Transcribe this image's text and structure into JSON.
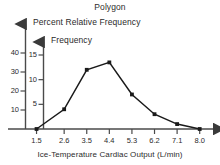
{
  "chart_data": {
    "type": "line",
    "title": "Polygon",
    "xlabel": "Ice-Temperature Cardiac Output (L/min)",
    "ylabel": "Frequency",
    "ylabel_secondary": "Percent Relative Frequency",
    "legend": [],
    "grid": false,
    "categories": [
      "1.5",
      "2.6",
      "3.5",
      "4.4",
      "5.3",
      "6.2",
      "7.1",
      "8.0"
    ],
    "x": [
      1.5,
      2.6,
      3.5,
      4.4,
      5.3,
      6.2,
      7.1,
      8.0
    ],
    "values": [
      0,
      4,
      12,
      13.5,
      7,
      3,
      1,
      0
    ],
    "series": [
      {
        "name": "Frequency",
        "values": [
          0,
          4,
          12,
          13.5,
          7,
          3,
          1,
          0
        ]
      }
    ],
    "yticks_frequency": [
      "5",
      "10",
      "15"
    ],
    "yticks_frequency_values": [
      5,
      10,
      15
    ],
    "ylim_frequency": [
      0,
      17.5
    ],
    "yticks_percent": [
      "10",
      "20",
      "30",
      "40"
    ],
    "yticks_percent_values": [
      10,
      20,
      30,
      40
    ],
    "ylim_percent": [
      0,
      47
    ],
    "xlim": [
      1.06,
      8.45
    ],
    "marker": "square",
    "line_color": "#1a1a1a",
    "marker_color": "#1a1a1a",
    "axis_color": "#4a4a4a"
  },
  "axes": {
    "percent_axis_label": "Percent Relative Frequency",
    "frequency_axis_label": "Frequency"
  }
}
